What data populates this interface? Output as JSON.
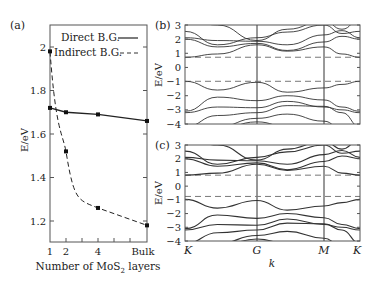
{
  "chart_data": [
    {
      "panel": "(a)",
      "type": "line",
      "title": "",
      "xlabel": "Number of MoS2 layers",
      "ylabel": "E/eV",
      "x_tick_labels": [
        "1",
        "2",
        "4",
        "Bulk"
      ],
      "x": [
        1,
        2,
        4,
        "Bulk"
      ],
      "ylim": [
        1.1,
        2.1
      ],
      "y_ticks": [
        1.2,
        1.4,
        1.6,
        1.8,
        2
      ],
      "legend_position": "upper right",
      "series": [
        {
          "name": "Direct B.G.",
          "style": "solid",
          "values": [
            1.72,
            1.7,
            1.69,
            1.66
          ]
        },
        {
          "name": "Indirect B.G.",
          "style": "dashed",
          "values": [
            1.98,
            1.52,
            1.26,
            1.18
          ]
        }
      ]
    },
    {
      "panel": "(b)",
      "type": "line",
      "title": "Band structure",
      "xlabel": "",
      "ylabel": "E/eV",
      "ylim": [
        -4,
        3
      ],
      "y_ticks": [
        -4,
        -3,
        -2,
        -1,
        0,
        1,
        2,
        3
      ],
      "high_symmetry_points": [
        "K",
        "G",
        "M",
        "K"
      ],
      "dashed_levels": [
        0.72,
        -0.98
      ]
    },
    {
      "panel": "(c)",
      "type": "line",
      "title": "Band structure",
      "xlabel": "k",
      "ylabel": "E/eV",
      "ylim": [
        -4,
        3
      ],
      "y_ticks": [
        -4,
        -3,
        -2,
        -1,
        0,
        1,
        2,
        3
      ],
      "x_tick_labels": [
        "K",
        "G",
        "M",
        "K"
      ],
      "high_symmetry_points": [
        "K",
        "G",
        "M",
        "K"
      ],
      "dashed_levels": [
        0.8,
        -0.75
      ]
    }
  ],
  "labels": {
    "panel_a": "(a)",
    "panel_b": "(b)",
    "panel_c": "(c)",
    "legend_direct": "Direct B.G.",
    "legend_indirect": "Indirect B.G.",
    "a_xlabel_pre": "Number of MoS",
    "a_xlabel_sub": "2",
    "a_xlabel_post": " layers",
    "ylabel": "E/eV",
    "k_label": "k"
  }
}
